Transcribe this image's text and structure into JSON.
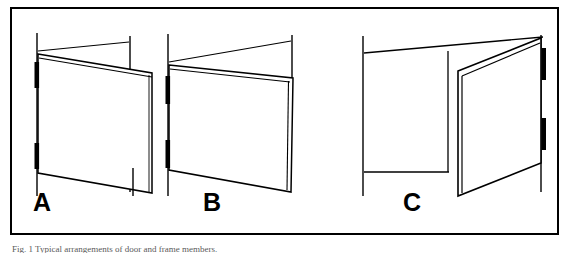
{
  "figure": {
    "kind": "technical-line-drawing",
    "title_label": "",
    "caption_text": "Fig. 1 Typical arrangements of door and frame members.",
    "border_color": "#000000",
    "line_color": "#000000",
    "fill_color": "#ffffff",
    "background": "#ffffff",
    "panels": [
      {
        "id": "A",
        "label": "A",
        "description": "Door hinged at left jamb, shown swung open toward viewer with leaf edge at right",
        "hinge_side": "left",
        "hinge_count": 2
      },
      {
        "id": "B",
        "label": "B",
        "description": "Door hinged at left jamb, shown swung open away from viewer with leaf edge at right",
        "hinge_side": "left",
        "hinge_count": 2
      },
      {
        "id": "C",
        "label": "C",
        "description": "Door hinged at right jamb, shown swung open approximately ninety degrees toward viewer, frame opening visible at left",
        "hinge_side": "right",
        "hinge_count": 2
      }
    ]
  },
  "geometry": {
    "panel_a": {
      "left_jamb": {
        "x": 37,
        "y_top": 33,
        "y_bottom": 196
      },
      "right_jamb": {
        "x": 130,
        "y_top": 36,
        "y_bottom": 192
      },
      "head_line": [
        [
          38,
          51
        ],
        [
          129,
          42
        ]
      ],
      "leaf_top": [
        [
          38,
          54
        ],
        [
          152,
          73
        ]
      ],
      "leaf_top_inner": [
        [
          38,
          57
        ],
        [
          152,
          76
        ]
      ],
      "leaf_right": [
        [
          152,
          73
        ],
        [
          152,
          193
        ]
      ],
      "leaf_bottom": [
        [
          38,
          173
        ],
        [
          152,
          193
        ]
      ],
      "leaf_left": [
        [
          38,
          54
        ],
        [
          38,
          173
        ]
      ],
      "hinges": [
        {
          "x": 37,
          "y": 62,
          "h": 26
        },
        {
          "x": 37,
          "y": 143,
          "h": 26
        }
      ]
    },
    "panel_b": {
      "left_jamb": {
        "x": 168,
        "y_top": 34,
        "y_bottom": 196
      },
      "right_jamb": {
        "x": 292,
        "y_top": 35,
        "y_bottom": 78
      },
      "head_line": [
        [
          169,
          62
        ],
        [
          291,
          41
        ]
      ],
      "leaf_top": [
        [
          169,
          65
        ],
        [
          293,
          78
        ]
      ],
      "leaf_top_inner": [
        [
          169,
          69
        ],
        [
          293,
          82
        ]
      ],
      "leaf_right": [
        [
          293,
          78
        ],
        [
          293,
          192
        ]
      ],
      "leaf_right_inner": [
        [
          289,
          80
        ],
        [
          289,
          190
        ]
      ],
      "leaf_bottom": [
        [
          169,
          170
        ],
        [
          291,
          192
        ]
      ],
      "leaf_left": [
        [
          169,
          65
        ],
        [
          169,
          170
        ]
      ],
      "hinges": [
        {
          "x": 168,
          "y": 76,
          "h": 28
        },
        {
          "x": 168,
          "y": 140,
          "h": 28
        }
      ]
    },
    "panel_c": {
      "left_jamb": {
        "x": 363,
        "y_top": 36,
        "y_bottom": 196
      },
      "frame_head": [
        [
          364,
          53
        ],
        [
          543,
          37
        ]
      ],
      "frame_sill": [
        [
          364,
          172
        ],
        [
          448,
          172
        ]
      ],
      "frame_post": {
        "x": 448,
        "y_top": 51,
        "y_bottom": 172
      },
      "right_jamb": {
        "x": 541,
        "y_top": 35,
        "y_bottom": 192
      },
      "leaf_top": [
        [
          458,
          71
        ],
        [
          541,
          38
        ]
      ],
      "leaf_top_inner": [
        [
          461,
          75
        ],
        [
          541,
          42
        ]
      ],
      "leaf_hinge_edge": [
        [
          458,
          71
        ],
        [
          458,
          196
        ]
      ],
      "leaf_hinge_edge_inner": [
        [
          462,
          75
        ],
        [
          462,
          193
        ]
      ],
      "leaf_bottom": [
        [
          458,
          196
        ],
        [
          541,
          163
        ]
      ],
      "leaf_right": [
        [
          541,
          38
        ],
        [
          541,
          163
        ]
      ],
      "hinges": [
        {
          "x": 541,
          "y": 48,
          "h": 32
        },
        {
          "x": 541,
          "y": 118,
          "h": 32
        }
      ]
    }
  },
  "labels": {
    "a": "A",
    "b": "B",
    "c": "C"
  }
}
